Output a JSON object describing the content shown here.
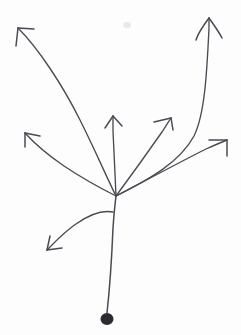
{
  "figure": {
    "kind": "line-drawing",
    "background_color": "#fdfdfd",
    "ink_color": "#4a4a52",
    "dot_color": "#2b2b31",
    "canvas": {
      "width": 241,
      "height": 335
    }
  },
  "chart_data": {
    "type": "diagram",
    "origin_dot": {
      "x": 107,
      "y": 319,
      "radius": 6
    },
    "junction": {
      "x": 116,
      "y": 196
    },
    "lower_junction": {
      "x": 113,
      "y": 212
    },
    "stem": {
      "name": "root-stem",
      "path": "M107,313 C110,286 112,252 113,228 C114,214 115,204 116,196",
      "from": "origin_dot",
      "to": "junction"
    },
    "branches": [
      {
        "id": "branch-top-left",
        "label": "upper-left long arrow",
        "tip": {
          "x": 15,
          "y": 26
        },
        "path": "M116,196 C107,178 96,152 80,120 C62,84 38,48 18,28",
        "barbs": [
          "M18,28 L16,46",
          "M18,28 L34,29"
        ]
      },
      {
        "id": "branch-left",
        "label": "left arrow",
        "tip": {
          "x": 22,
          "y": 131
        },
        "path": "M116,196 C100,188 82,178 64,166 C48,155 34,143 25,133",
        "barbs": [
          "M25,133 L25,147",
          "M25,133 L40,136"
        ]
      },
      {
        "id": "branch-up-center",
        "label": "center vertical arrow",
        "tip": {
          "x": 113,
          "y": 113
        },
        "path": "M116,196 C115,175 114,150 113,131 C113,124 113,120 113,116",
        "barbs": [
          "M113,116 L105,128",
          "M113,116 L122,126"
        ]
      },
      {
        "id": "branch-up-right",
        "label": "upper-right diagonal arrow",
        "tip": {
          "x": 172,
          "y": 116
        },
        "path": "M116,196 C130,177 148,152 162,132 C166,126 169,121 171,118",
        "barbs": [
          "M171,118 L154,122",
          "M171,118 L173,130"
        ]
      },
      {
        "id": "branch-right",
        "label": "right arrow",
        "tip": {
          "x": 229,
          "y": 138
        },
        "path": "M116,196 C145,181 178,163 206,149 C215,145 222,142 227,140",
        "barbs": [
          "M227,140 L209,140",
          "M227,140 L227,156"
        ]
      },
      {
        "id": "branch-far-right-curve",
        "label": "far-right tall curving arrow",
        "tip": {
          "x": 210,
          "y": 16
        },
        "path": "M116,196 C150,179 180,162 194,136 C205,114 207,70 209,28 C209,24 209,20 209,18",
        "barbs": [
          "M209,18 C203,26 198,33 196,40",
          "M209,18 C214,25 219,32 222,38"
        ]
      },
      {
        "id": "branch-lower-left",
        "label": "lower-left downward arrow",
        "tip": {
          "x": 45,
          "y": 252
        },
        "path": "M113,212 C103,210 90,214 76,224 C64,232 54,243 47,250",
        "barbs": [
          "M47,250 L50,236",
          "M47,250 L62,248"
        ]
      }
    ],
    "legend": null,
    "axes": null,
    "grid": false
  }
}
